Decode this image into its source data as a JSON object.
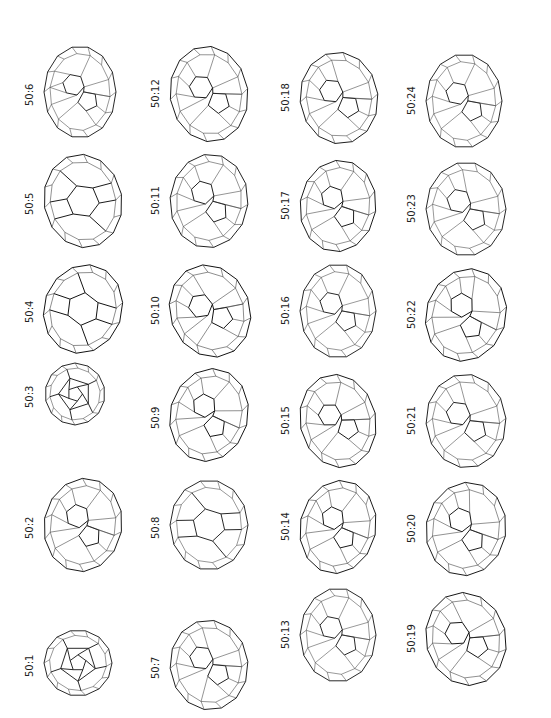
{
  "figure": {
    "orientation": "rotated-90-ccw",
    "items": [
      {
        "label": "50:1",
        "x": 42,
        "y": 628,
        "w": 72,
        "h": 70,
        "style": "pent-center",
        "rot": 0
      },
      {
        "label": "50:2",
        "x": 42,
        "y": 476,
        "w": 82,
        "h": 98,
        "style": "dense",
        "rot": 10
      },
      {
        "label": "50:3",
        "x": 42,
        "y": 362,
        "w": 66,
        "h": 64,
        "style": "pent-center",
        "rot": 90
      },
      {
        "label": "50:4",
        "x": 42,
        "y": 262,
        "w": 82,
        "h": 94,
        "style": "sparse",
        "rot": 20
      },
      {
        "label": "50:5",
        "x": 42,
        "y": 152,
        "w": 82,
        "h": 98,
        "style": "sparse",
        "rot": -10
      },
      {
        "label": "50:6",
        "x": 42,
        "y": 44,
        "w": 76,
        "h": 96,
        "style": "dense",
        "rot": 0
      },
      {
        "label": "50:7",
        "x": 168,
        "y": 618,
        "w": 82,
        "h": 94,
        "style": "dense",
        "rot": -5
      },
      {
        "label": "50:8",
        "x": 168,
        "y": 478,
        "w": 82,
        "h": 94,
        "style": "sparse",
        "rot": 0
      },
      {
        "label": "50:9",
        "x": 168,
        "y": 366,
        "w": 82,
        "h": 98,
        "style": "dense",
        "rot": 15
      },
      {
        "label": "50:10",
        "x": 168,
        "y": 262,
        "w": 84,
        "h": 98,
        "style": "dense",
        "rot": -20
      },
      {
        "label": "50:11",
        "x": 168,
        "y": 152,
        "w": 82,
        "h": 98,
        "style": "dense",
        "rot": 5
      },
      {
        "label": "50:12",
        "x": 168,
        "y": 44,
        "w": 82,
        "h": 100,
        "style": "dense",
        "rot": -8
      },
      {
        "label": "50:13",
        "x": 298,
        "y": 586,
        "w": 80,
        "h": 98,
        "style": "dense",
        "rot": 0
      },
      {
        "label": "50:14",
        "x": 298,
        "y": 478,
        "w": 80,
        "h": 98,
        "style": "dense",
        "rot": 12
      },
      {
        "label": "50:15",
        "x": 298,
        "y": 372,
        "w": 80,
        "h": 98,
        "style": "dense",
        "rot": -12
      },
      {
        "label": "50:16",
        "x": 298,
        "y": 262,
        "w": 80,
        "h": 98,
        "style": "dense",
        "rot": 0
      },
      {
        "label": "50:17",
        "x": 298,
        "y": 158,
        "w": 80,
        "h": 96,
        "style": "dense",
        "rot": 8
      },
      {
        "label": "50:18",
        "x": 298,
        "y": 50,
        "w": 82,
        "h": 96,
        "style": "dense",
        "rot": -6
      },
      {
        "label": "50:19",
        "x": 424,
        "y": 590,
        "w": 84,
        "h": 98,
        "style": "dense",
        "rot": -15
      },
      {
        "label": "50:20",
        "x": 424,
        "y": 480,
        "w": 84,
        "h": 98,
        "style": "dense",
        "rot": 10
      },
      {
        "label": "50:21",
        "x": 424,
        "y": 372,
        "w": 84,
        "h": 98,
        "style": "dense",
        "rot": -4
      },
      {
        "label": "50:22",
        "x": 424,
        "y": 266,
        "w": 84,
        "h": 98,
        "style": "dense",
        "rot": 18
      },
      {
        "label": "50:23",
        "x": 424,
        "y": 160,
        "w": 84,
        "h": 98,
        "style": "dense",
        "rot": 0
      },
      {
        "label": "50:24",
        "x": 424,
        "y": 52,
        "w": 80,
        "h": 98,
        "style": "dense",
        "rot": 0
      }
    ]
  }
}
